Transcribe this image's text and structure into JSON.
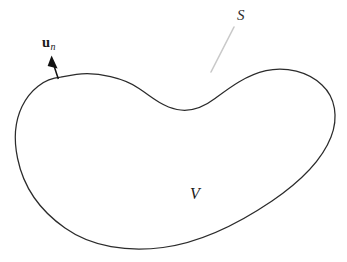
{
  "figure": {
    "width": 347,
    "height": 262,
    "background_color": "#ffffff",
    "stroke_color": "#2b2b2b",
    "leader_color": "#c9c9c9",
    "labels": {
      "normal_vector": {
        "symbol": "u",
        "subscript": "n",
        "full": "u_n",
        "meaning": "outward unit normal vector",
        "x": 48,
        "y": 44
      },
      "surface": {
        "symbol": "S",
        "meaning": "bounding surface",
        "x": 243,
        "y": 18
      },
      "volume": {
        "symbol": "V",
        "meaning": "enclosed volume",
        "x": 196,
        "y": 195
      }
    },
    "arrow": {
      "name": "normal-vector-arrow",
      "tail_x": 58,
      "tail_y": 79,
      "head_x": 52,
      "head_y": 56,
      "head_style": "solid-filled-triangle"
    },
    "leader_line": {
      "name": "surface-leader-line",
      "from_x": 234,
      "from_y": 27,
      "to_x": 211,
      "to_y": 72,
      "style": "faded-solid"
    },
    "outline_path": "M 60.5 77.2 C 44 78.5 30.5 90 22.5 106.5 C 14.5 123 14 141 17.5 158.5 C 23 186 40 210.5 65 228 C 92 247 128 252 163 247.5 C 200 242.5 238 224 272 201 C 300 182 322 160 331 137 C 338.5 118 335.5 98 322 85 C 308 71.5 286 66.5 266 70.5 C 246 74.5 229 88 215 98.5 C 203 107.5 190 112 177 109.5 C 163 107 151 97 139 88.5 C 125 79 98 71.5 76.5 74.5 C 71 75.2 65.5 76.2 60.5 77.2 Z"
  }
}
